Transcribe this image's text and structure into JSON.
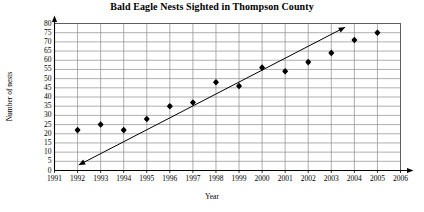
{
  "chart_data": {
    "type": "scatter",
    "title": "Bald Eagle Nests Sighted in Thompson County",
    "xlabel": "Year",
    "ylabel": "Number of nests",
    "grid": true,
    "legend": "none",
    "xlim": [
      1991,
      2006
    ],
    "ylim": [
      0,
      80
    ],
    "xticks": [
      "1991",
      "1992",
      "1993",
      "1994",
      "1995",
      "1996",
      "1997",
      "1998",
      "1999",
      "2000",
      "2001",
      "2002",
      "2003",
      "2004",
      "2005",
      "2006"
    ],
    "yticks": [
      "0",
      "5",
      "10",
      "15",
      "20",
      "25",
      "30",
      "35",
      "40",
      "45",
      "50",
      "55",
      "60",
      "65",
      "70",
      "75",
      "80"
    ],
    "x": [
      1992,
      1993,
      1994,
      1995,
      1996,
      1997,
      1998,
      1999,
      2000,
      2001,
      2002,
      2003,
      2004,
      2005
    ],
    "values": [
      22,
      25,
      22,
      28,
      35,
      37,
      48,
      46,
      56,
      54,
      59,
      64,
      71,
      75
    ],
    "series": [
      {
        "name": "Nests sighted",
        "marker": "filled-diamond",
        "color": "#000000",
        "points": [
          {
            "x": 1992,
            "y": 22
          },
          {
            "x": 1993,
            "y": 25
          },
          {
            "x": 1994,
            "y": 22
          },
          {
            "x": 1995,
            "y": 28
          },
          {
            "x": 1996,
            "y": 35
          },
          {
            "x": 1997,
            "y": 37
          },
          {
            "x": 1998,
            "y": 48
          },
          {
            "x": 1999,
            "y": 46
          },
          {
            "x": 2000,
            "y": 56
          },
          {
            "x": 2001,
            "y": 54
          },
          {
            "x": 2002,
            "y": 59
          },
          {
            "x": 2003,
            "y": 64
          },
          {
            "x": 2004,
            "y": 71
          },
          {
            "x": 2005,
            "y": 75
          }
        ]
      }
    ],
    "trend_line": {
      "name": "line of best fit",
      "color": "#000000",
      "arrows": "both",
      "start": {
        "x": 1992.05,
        "y": 3
      },
      "end": {
        "x": 2003.6,
        "y": 78
      }
    }
  }
}
